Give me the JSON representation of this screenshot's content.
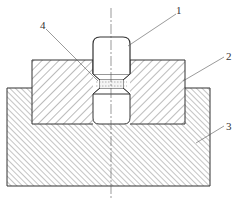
{
  "diagram": {
    "type": "mechanical cross-section",
    "labels": [
      {
        "id": "1",
        "text": "1",
        "target": "punch"
      },
      {
        "id": "2",
        "text": "2",
        "target": "die"
      },
      {
        "id": "3",
        "text": "3",
        "target": "base"
      },
      {
        "id": "4",
        "text": "4",
        "target": "workpiece"
      }
    ],
    "colors": {
      "line": "#333333",
      "hatch": "#555555",
      "background": "#ffffff"
    }
  }
}
